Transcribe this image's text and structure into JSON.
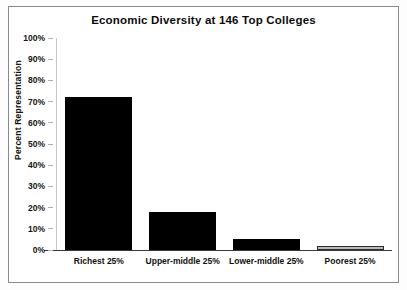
{
  "chart_data": {
    "type": "bar",
    "title": "Economic Diversity at 146 Top Colleges",
    "xlabel": "",
    "ylabel": "Percent Representation",
    "categories": [
      "Richest 25%",
      "Upper-middle 25%",
      "Lower-middle 25%",
      "Poorest 25%"
    ],
    "values": [
      72,
      18,
      5,
      2
    ],
    "ylim": [
      0,
      100
    ],
    "yticks": [
      0,
      10,
      20,
      30,
      40,
      50,
      60,
      70,
      80,
      90,
      100
    ],
    "ytick_labels": [
      "0%",
      "10%",
      "20%",
      "30%",
      "40%",
      "50%",
      "60%",
      "70%",
      "80%",
      "90%",
      "100%"
    ],
    "grid": false,
    "legend": "none",
    "bar_colors": [
      "#000000",
      "#000000",
      "#000000",
      "#b9b9b9"
    ],
    "series": [
      {
        "name": "Percent Representation",
        "values": [
          72,
          18,
          5,
          2
        ]
      }
    ]
  }
}
